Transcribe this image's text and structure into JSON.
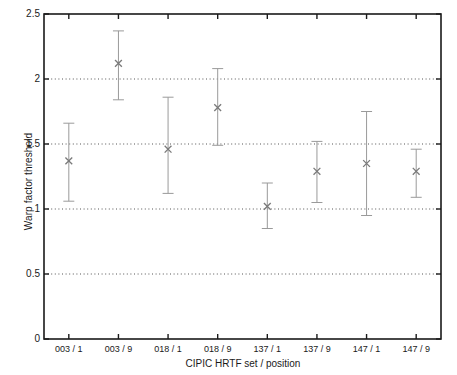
{
  "chart_data": {
    "type": "scatter",
    "title": "",
    "xlabel": "CIPIC HRTF set / position",
    "ylabel": "Warp factor threshold",
    "categories": [
      "003 / 1",
      "003 / 9",
      "018 / 1",
      "018 / 9",
      "137 / 1",
      "137 / 9",
      "147 / 1",
      "147 / 9"
    ],
    "values": [
      1.37,
      2.12,
      1.46,
      1.78,
      1.02,
      1.29,
      1.35,
      1.29
    ],
    "error_upper": [
      1.66,
      2.37,
      1.86,
      2.08,
      1.2,
      1.52,
      1.75,
      1.46
    ],
    "error_lower": [
      1.06,
      1.84,
      1.12,
      1.49,
      0.85,
      1.05,
      0.95,
      1.09
    ],
    "marker": "x",
    "ylim": [
      0,
      2.5
    ],
    "yticks": [
      0,
      0.5,
      1,
      1.5,
      2,
      2.5
    ],
    "ytick_labels": [
      "0",
      "0.5",
      "1",
      "1.5",
      "2",
      "2.5"
    ],
    "grid": "horizontal-dotted-at-0.5-1-1.5-2",
    "legend": "none",
    "series": [
      {
        "name": "Warp factor threshold",
        "values": [
          1.37,
          2.12,
          1.46,
          1.78,
          1.02,
          1.29,
          1.35,
          1.29
        ],
        "error_upper": [
          1.66,
          2.37,
          1.86,
          2.08,
          1.2,
          1.52,
          1.75,
          1.46
        ],
        "error_lower": [
          1.06,
          1.84,
          1.12,
          1.49,
          0.85,
          1.05,
          0.95,
          1.09
        ]
      }
    ],
    "colors": {
      "axis": "#1a1a1a",
      "grid": "#555555",
      "marker": "#7a7a7a",
      "errorbar": "#9a9a9a",
      "background": "#ffffff"
    }
  }
}
